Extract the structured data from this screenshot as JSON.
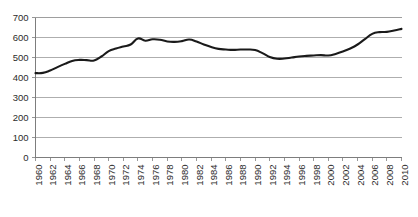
{
  "chart_data": {
    "type": "line",
    "title": "",
    "subtitle": "",
    "xlabel": "",
    "ylabel": "",
    "xlim": [
      1960,
      2010
    ],
    "ylim": [
      0,
      700
    ],
    "y_ticks": [
      0,
      100,
      200,
      300,
      400,
      500,
      600,
      700
    ],
    "x_ticks": [
      1960,
      1962,
      1964,
      1966,
      1968,
      1970,
      1972,
      1974,
      1976,
      1978,
      1980,
      1982,
      1984,
      1986,
      1988,
      1990,
      1992,
      1994,
      1996,
      1998,
      2000,
      2002,
      2004,
      2006,
      2008,
      2010
    ],
    "x_tick_labels": [
      "1960",
      "1962",
      "1964",
      "1966",
      "1968",
      "1970",
      "1972",
      "1974",
      "1976",
      "1978",
      "1980",
      "1982",
      "1984",
      "1986",
      "1988",
      "1990",
      "1992",
      "1994",
      "1996",
      "1998",
      "2000",
      "2002",
      "2004",
      "2006",
      "2008",
      "2010"
    ],
    "y_tick_labels": [
      "0",
      "100",
      "200",
      "300",
      "400",
      "500",
      "600",
      "700"
    ],
    "grid": true,
    "grid_axis": "y",
    "legend": false,
    "legend_position": "none",
    "annotations": [],
    "line_color": "#1a1a1a",
    "grid_color": "#9a9a9a",
    "background_color": "#ffffff",
    "x": [
      1960,
      1961,
      1962,
      1963,
      1964,
      1965,
      1966,
      1967,
      1968,
      1969,
      1970,
      1971,
      1972,
      1973,
      1974,
      1975,
      1976,
      1977,
      1978,
      1979,
      1980,
      1981,
      1982,
      1983,
      1984,
      1985,
      1986,
      1987,
      1988,
      1989,
      1990,
      1991,
      1992,
      1993,
      1994,
      1995,
      1996,
      1997,
      1998,
      1999,
      2000,
      2001,
      2002,
      2003,
      2004,
      2005,
      2006,
      2007,
      2008,
      2009,
      2010
    ],
    "series": [
      {
        "name": "Series 1",
        "values": [
          422,
          423,
          435,
          452,
          468,
          483,
          488,
          487,
          485,
          505,
          532,
          545,
          555,
          565,
          595,
          584,
          591,
          589,
          580,
          578,
          582,
          590,
          580,
          565,
          552,
          543,
          540,
          538,
          540,
          540,
          537,
          522,
          503,
          494,
          495,
          500,
          505,
          508,
          510,
          512,
          510,
          518,
          530,
          545,
          565,
          592,
          618,
          627,
          628,
          635,
          643
        ]
      }
    ]
  }
}
